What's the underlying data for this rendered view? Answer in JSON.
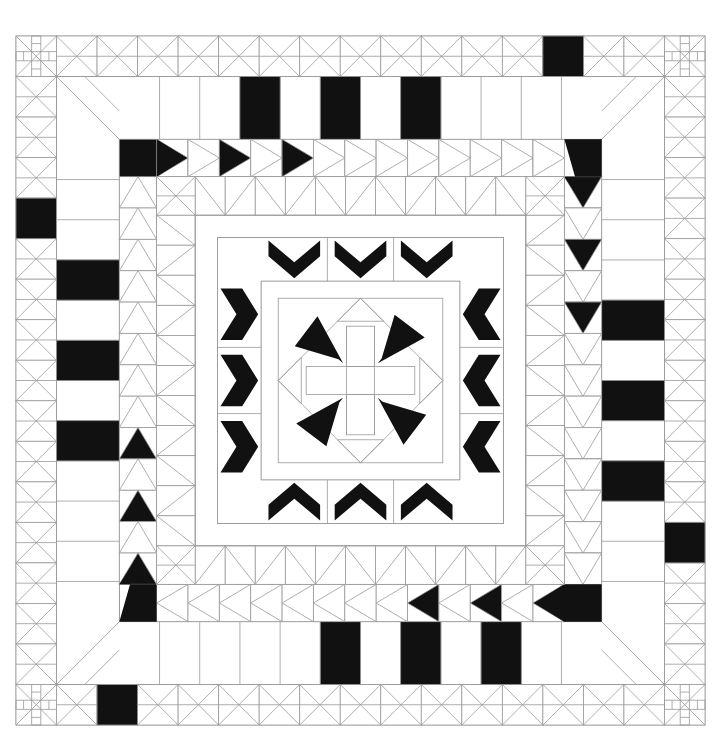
{
  "document": {
    "title": "Medallion Quilt Pattern Diagram",
    "type": "quilt-block-diagram",
    "description": "Symmetric black-and-white medallion quilt layout diagram drawn as line art"
  },
  "canvas": {
    "width": 721,
    "height": 755,
    "background": "#ffffff"
  },
  "style": {
    "line_color": "#999999",
    "line_color_strong": "#777777",
    "patch_dark": "#111111",
    "patch_light": "#ffffff",
    "stroke_width": 0.8
  },
  "quilt": {
    "origin_x": 16,
    "origin_y": 36,
    "size": 689,
    "unit": 40.53,
    "units_across": 17,
    "rings": [
      {
        "name": "outer-border",
        "index": 0,
        "block_type": "hourglass-x-block",
        "corner_block_type": "woven-cross-corner-block",
        "blocks_per_side": 17,
        "dark_patch_positions": {
          "top": [
            13
          ],
          "right": [
            12
          ],
          "bottom": [
            2
          ],
          "left": [
            4
          ]
        }
      },
      {
        "name": "second-border-plain",
        "index": 1,
        "block_type": "plain-rectangle-with-diagonal",
        "dark_rect_counts": {
          "top": 3,
          "right": 3,
          "bottom": 3,
          "left": 3
        }
      },
      {
        "name": "flying-geese-border",
        "index": 2,
        "block_type": "flying-geese",
        "direction": {
          "top": "right",
          "right": "down",
          "bottom": "left",
          "left": "up"
        },
        "geese_per_side": 13,
        "dark_geese_per_side": 4,
        "large_corner_goose": true
      },
      {
        "name": "sawtooth-border",
        "index": 3,
        "block_type": "half-square-triangle-sawtooth",
        "blocks_per_side": 11
      },
      {
        "name": "inner-plain-ring",
        "index": 4,
        "block_type": "plain-strip"
      },
      {
        "name": "chevron-ring",
        "index": 5,
        "block_type": "double-chevron",
        "chevrons_per_side": 3,
        "pointing": {
          "top": "down",
          "right": "left",
          "bottom": "up",
          "left": "right"
        }
      },
      {
        "name": "center-medallion",
        "index": 6,
        "block_type": "eight-point-star-on-square-in-square",
        "motif": "four-petal-pinwheel-cross",
        "petals": 4
      }
    ]
  },
  "legend": {
    "dark_label": "dark fabric",
    "light_label": "light fabric",
    "line_label": "seam line"
  }
}
